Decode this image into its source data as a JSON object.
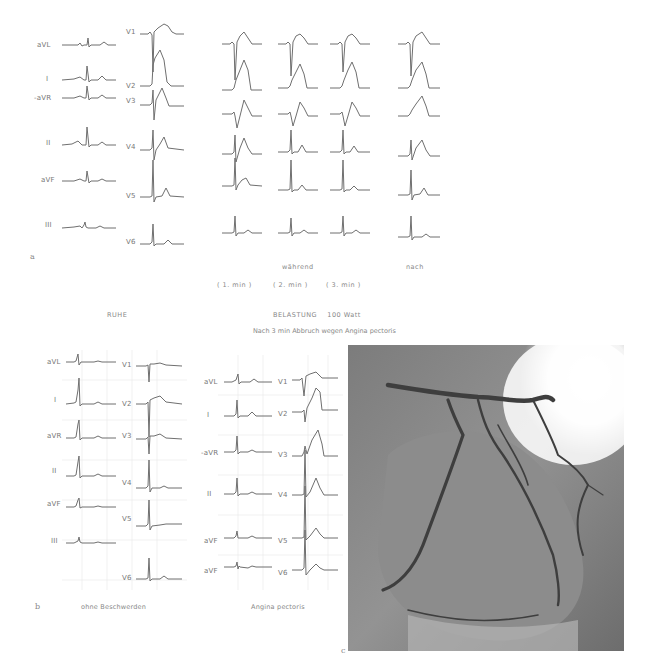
{
  "figure": {
    "panel_a": {
      "letter": "a",
      "limb_leads": [
        "aVL",
        "I",
        "-aVR",
        "II",
        "aVF",
        "III"
      ],
      "chest_leads": [
        "V1",
        "V2",
        "V3",
        "V4",
        "V5",
        "V6"
      ],
      "caption_during": "während",
      "caption_after": "nach",
      "minutes": [
        "( 1. min )",
        "( 2. min )",
        "( 3. min )"
      ],
      "rest_label": "RUHE",
      "load_label": "BELASTUNG    100 Watt",
      "abort_note": "Nach 3 min Abbruch wegen Angina pectoris"
    },
    "panel_b": {
      "letter": "b",
      "left": {
        "limb_leads": [
          "aVL",
          "I",
          "aVR",
          "II",
          "aVF",
          "III"
        ],
        "chest_leads": [
          "V1",
          "V2",
          "V3",
          "V4",
          "V5",
          "V6"
        ],
        "caption": "ohne Beschwerden"
      },
      "right": {
        "limb_leads": [
          "aVL",
          "I",
          "-aVR",
          "II",
          "aVF",
          "aVF"
        ],
        "chest_leads": [
          "V1",
          "V2",
          "V3",
          "V4",
          "V5",
          "V6"
        ],
        "caption": "Angina pectoris"
      }
    },
    "panel_c": {
      "letter": "c",
      "description": "coronary-angiogram"
    }
  }
}
